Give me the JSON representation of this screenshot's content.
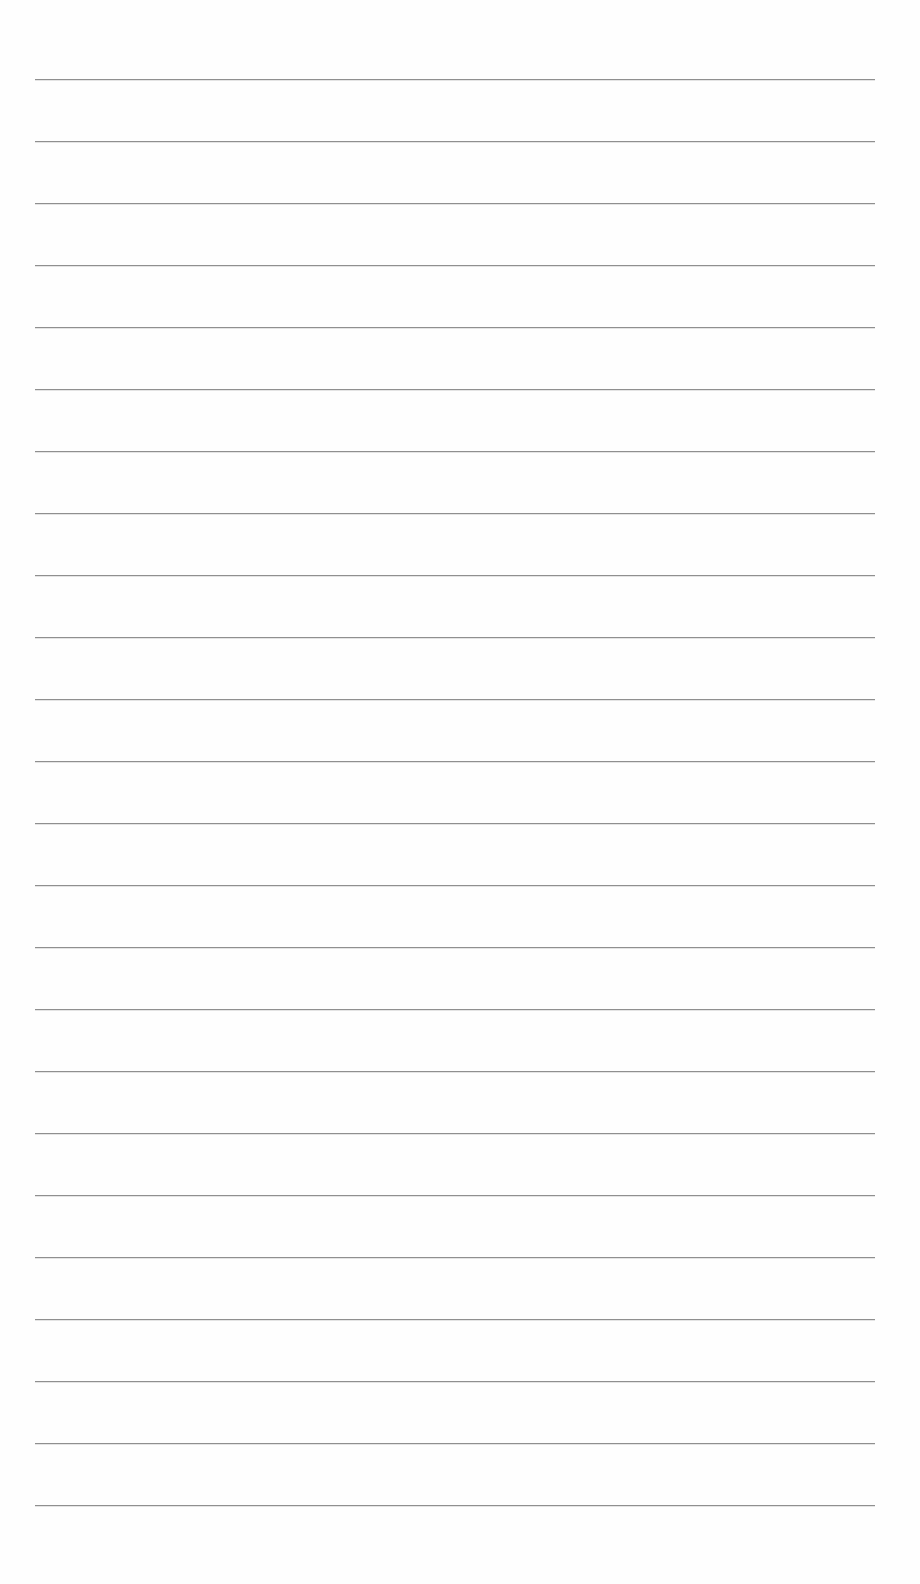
{
  "document": {
    "type": "lined-paper",
    "background_color": "#fefefe",
    "line_color": "#8f8f8f",
    "line_count": 24,
    "first_line_y": 79,
    "line_spacing": 62,
    "line_left": 35,
    "line_width": 840,
    "text": ""
  }
}
